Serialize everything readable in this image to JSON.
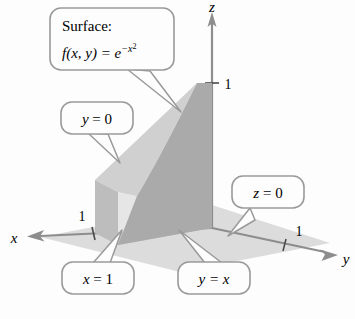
{
  "figure": {
    "name": "solid-region-under-surface",
    "background_color": "#fdfdfd"
  },
  "axes": {
    "x": {
      "label": "x",
      "tick_label": "1"
    },
    "y": {
      "label": "y",
      "tick_label": "1"
    },
    "z": {
      "label": "z",
      "tick_label": "1"
    }
  },
  "callouts": {
    "surface": {
      "title": "Surface:",
      "equation_lhs": "f(x, y) = e",
      "equation_exp": "−x",
      "equation_exp_sup": "2"
    },
    "y_zero": {
      "text_var": "y",
      "text_rest": " = 0"
    },
    "z_zero": {
      "text_var": "z",
      "text_rest": " = 0"
    },
    "x_one": {
      "text_var": "x",
      "text_rest": " = 1"
    },
    "y_eq_x": {
      "text_var": "y",
      "text_rest": " = x"
    }
  },
  "colors": {
    "ground_plane": "#dcdcdc",
    "left_face": "#e6e6e6",
    "curved_face": "#aaaaaa",
    "front_face": "#bdbdbd",
    "base_face": "#c6c6c6",
    "axis_line": "#8d8d8d",
    "callout_border": "#9a9a9a",
    "callout_fill": "#fdfdfd",
    "text": "#3b3b3b"
  }
}
